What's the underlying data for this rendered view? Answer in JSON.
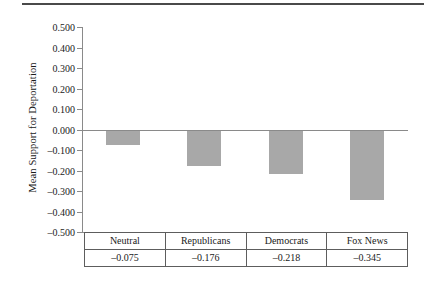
{
  "chart_data": {
    "type": "bar",
    "title": "",
    "subtitle": "",
    "xlabel": "",
    "ylabel": "Mean Support for Deportation",
    "categories": [
      "Neutral",
      "Republicans",
      "Democrats",
      "Fox News"
    ],
    "values": [
      -0.075,
      -0.176,
      -0.218,
      -0.345
    ],
    "value_labels": [
      "–0.075",
      "–0.176",
      "–0.218",
      "–0.345"
    ],
    "ylim": [
      -0.5,
      0.5
    ],
    "ytick_values": [
      0.5,
      0.4,
      0.3,
      0.2,
      0.1,
      0.0,
      -0.1,
      -0.2,
      -0.3,
      -0.4,
      -0.5
    ],
    "ytick_labels": [
      "0.500",
      "0.400",
      "0.300",
      "0.200",
      "0.100",
      "0.000",
      "–0.100",
      "–0.200",
      "–0.300",
      "–0.400",
      "–0.500"
    ],
    "grid": false,
    "legend": false,
    "legend_position": "none",
    "bar_color": "#a8a8a8",
    "axis_color": "#8a8a8a",
    "zero_line": 0.0,
    "table_below": true
  },
  "table": {
    "header_row": [
      "Neutral",
      "Republicans",
      "Democrats",
      "Fox News"
    ],
    "value_row": [
      "–0.075",
      "–0.176",
      "–0.218",
      "–0.345"
    ]
  },
  "rule": {
    "top_divider": "horizontal-rule"
  }
}
